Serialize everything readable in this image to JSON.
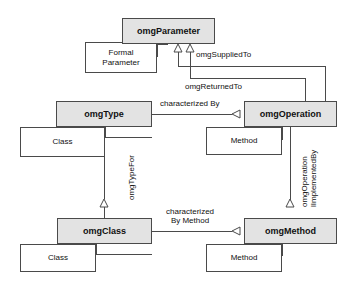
{
  "diagram": {
    "colors": {
      "node_fill": "#e3e3e3",
      "sub_fill": "#ffffff",
      "stroke": "#4a4a4a",
      "text": "#111111",
      "background": "#ffffff"
    },
    "nodes": [
      {
        "id": "omgParameter",
        "label": "omgParameter",
        "x": 122,
        "y": 18,
        "w": 93,
        "h": 26
      },
      {
        "id": "omgType",
        "label": "omgType",
        "x": 56,
        "y": 101,
        "w": 96,
        "h": 26
      },
      {
        "id": "omgOperation",
        "label": "omgOperation",
        "x": 244,
        "y": 101,
        "w": 93,
        "h": 26
      },
      {
        "id": "omgClass",
        "label": "omgClass",
        "x": 57,
        "y": 218,
        "w": 95,
        "h": 26
      },
      {
        "id": "omgMethod",
        "label": "omgMethod",
        "x": 244,
        "y": 218,
        "w": 93,
        "h": 26
      }
    ],
    "subnodes": [
      {
        "id": "formalParameter",
        "label": "Formal\nParameter",
        "x": 85,
        "y": 42,
        "w": 72,
        "h": 31
      },
      {
        "id": "typeClass",
        "label": "Class",
        "x": 20,
        "y": 127,
        "w": 85,
        "h": 30
      },
      {
        "id": "operationMethod",
        "label": "Method",
        "x": 206,
        "y": 127,
        "w": 76,
        "h": 28
      },
      {
        "id": "classClass",
        "label": "Class",
        "x": 20,
        "y": 244,
        "w": 76,
        "h": 28
      },
      {
        "id": "methodMethod",
        "label": "Method",
        "x": 206,
        "y": 244,
        "w": 76,
        "h": 28
      }
    ],
    "edge_labels": [
      {
        "id": "omgSuppliedTo",
        "text": "omgSuppliedTo",
        "x": 196,
        "y": 50,
        "orientation": "horizontal"
      },
      {
        "id": "omgReturnedTo",
        "text": "omgReturnedTo",
        "x": 185,
        "y": 82,
        "orientation": "horizontal"
      },
      {
        "id": "characterizedBy",
        "text": "characterized By",
        "x": 160,
        "y": 99,
        "orientation": "horizontal"
      },
      {
        "id": "omgTypeFor",
        "text": "omgTypeFor",
        "x": 127,
        "y": 200,
        "orientation": "vertical"
      },
      {
        "id": "omgOperationIsImplementedBy",
        "text": "omgOperation\nlImplementedBy",
        "x": 303,
        "y": 205,
        "orientation": "vertical"
      },
      {
        "id": "characterizedByMethod",
        "text": "characterized\nBy Method",
        "x": 166,
        "y": 207,
        "orientation": "horizontal"
      }
    ],
    "relationships": [
      {
        "from": "omgParameter",
        "to": "omgOperation",
        "label": "omgSuppliedTo",
        "arrow": "hollow-triangle"
      },
      {
        "from": "omgParameter",
        "to": "omgOperation",
        "label": "omgReturnedTo",
        "arrow": "hollow-triangle"
      },
      {
        "from": "omgType",
        "to": "omgOperation",
        "label": "characterized By",
        "arrow": "hollow-triangle"
      },
      {
        "from": "omgClass",
        "to": "omgType",
        "label": "omgTypeFor",
        "arrow": "hollow-triangle"
      },
      {
        "from": "omgMethod",
        "to": "omgOperation",
        "label": "omgOperation lImplementedBy",
        "arrow": "hollow-triangle"
      },
      {
        "from": "omgClass",
        "to": "omgMethod",
        "label": "characterized By Method",
        "arrow": "hollow-triangle"
      }
    ]
  }
}
